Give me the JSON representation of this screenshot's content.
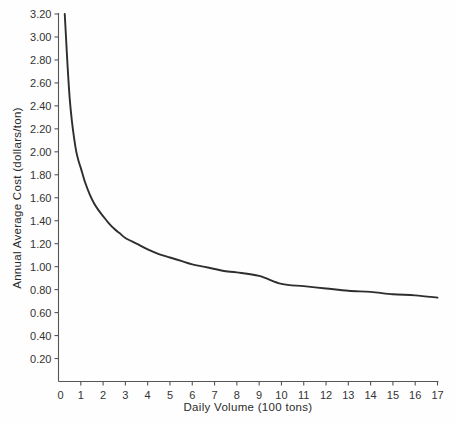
{
  "chart_data": {
    "type": "line",
    "title": "",
    "xlabel": "Daily Volume (100 tons)",
    "ylabel": "Annual Average Cost (dollars/ton)",
    "xlim": [
      0,
      17
    ],
    "ylim": [
      0,
      3.2
    ],
    "grid": false,
    "legend": "none",
    "x_ticks": [
      0,
      1,
      2,
      3,
      4,
      5,
      6,
      7,
      8,
      9,
      10,
      11,
      12,
      13,
      14,
      15,
      16,
      17
    ],
    "x_tick_labels": [
      "0",
      "1",
      "2",
      "3",
      "4",
      "5",
      "6",
      "7",
      "8",
      "9",
      "10",
      "11",
      "12",
      "13",
      "14",
      "15",
      "16",
      "17"
    ],
    "y_ticks": [
      0,
      0.2,
      0.4,
      0.6,
      0.8,
      1.0,
      1.2,
      1.4,
      1.6,
      1.8,
      2.0,
      2.2,
      2.4,
      2.6,
      2.8,
      3.0,
      3.2
    ],
    "y_tick_labels": [
      "0",
      "0.20",
      "0.40",
      "0.60",
      "0.80",
      "1.00",
      "1.20",
      "1.40",
      "1.60",
      "1.80",
      "2.00",
      "2.20",
      "2.40",
      "2.60",
      "2.80",
      "3.00",
      "3.20"
    ],
    "series": [
      {
        "name": "Annual Average Cost",
        "color": "#2e2e2e",
        "x": [
          0.28,
          0.35,
          0.4,
          0.5,
          0.6,
          0.7,
          0.8,
          0.9,
          1.0,
          1.2,
          1.4,
          1.6,
          1.8,
          2.0,
          2.25,
          2.5,
          2.75,
          3.0,
          3.5,
          4.0,
          4.5,
          5.0,
          5.5,
          6.0,
          6.5,
          7.0,
          7.5,
          8.0,
          9.0,
          10.0,
          11.0,
          12.0,
          13.0,
          14.0,
          15.0,
          16.0,
          17.0
        ],
        "y": [
          3.2,
          2.95,
          2.77,
          2.47,
          2.27,
          2.12,
          2.0,
          1.92,
          1.86,
          1.73,
          1.63,
          1.55,
          1.49,
          1.44,
          1.38,
          1.33,
          1.29,
          1.25,
          1.2,
          1.15,
          1.11,
          1.08,
          1.05,
          1.02,
          1.0,
          0.98,
          0.96,
          0.95,
          0.92,
          0.85,
          0.83,
          0.81,
          0.79,
          0.78,
          0.76,
          0.75,
          0.73
        ]
      }
    ]
  },
  "axes": {
    "x_axis_title": "Daily Volume (100 tons)",
    "y_axis_title": "Annual Average Cost  (dollars/ton)"
  }
}
